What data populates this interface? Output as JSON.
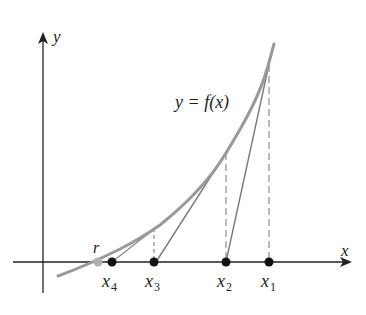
{
  "diagram": {
    "title": "",
    "axes": {
      "x_label": "x",
      "y_label": "y"
    },
    "curve_label": "y = f(x)",
    "root_label": "r",
    "points": [
      {
        "name": "x",
        "sub": "4",
        "px": 112
      },
      {
        "name": "x",
        "sub": "3",
        "px": 154
      },
      {
        "name": "x",
        "sub": "2",
        "px": 226
      },
      {
        "name": "x",
        "sub": "1",
        "px": 269
      }
    ],
    "colors": {
      "curve": "#9a9a9a",
      "tangent": "#7a7a7a",
      "axis": "#222222",
      "point": "#111111",
      "root_point": "#b0b0b0"
    }
  }
}
